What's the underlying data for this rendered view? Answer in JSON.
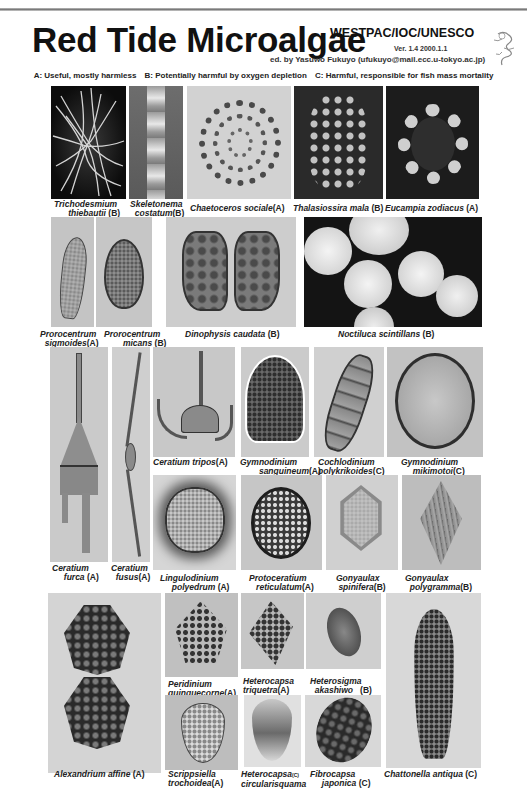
{
  "header": {
    "title": "Red Tide Microalgae",
    "organization": "WESTPAC/IOC/UNESCO",
    "version": "Ver. 1.4   2000.1.1",
    "logo_label": "WESTPAC-HAB",
    "editor": "ed. by Yasuwo Fukuyo (ufukuyo@mail.ecc.u-tokyo.ac.jp)"
  },
  "legend": {
    "a": "A: Useful, mostly harmless",
    "b": "B: Potentially harmful by oxygen depletion",
    "c": "C: Harmful, responsible for fish mass mortality"
  },
  "species": [
    {
      "genus": "Trichodesmium",
      "species": "thiebautii",
      "category": "(B)"
    },
    {
      "genus": "Skeletonema",
      "species": "costatum",
      "category": "(B)"
    },
    {
      "genus": "Chaetoceros",
      "species": "sociale",
      "category": "(A)"
    },
    {
      "genus": "Thalasiossira",
      "species": "mala",
      "category": "(B)"
    },
    {
      "genus": "Eucampia",
      "species": "zodiacus",
      "category": "(A)"
    },
    {
      "genus": "Prorocentrum",
      "species": "sigmoides",
      "category": "(A)"
    },
    {
      "genus": "Prorocentrum",
      "species": "micans",
      "category": "(B)"
    },
    {
      "genus": "Dinophysis",
      "species": "caudata",
      "category": "(B)"
    },
    {
      "genus": "Noctiluca",
      "species": "scintillans",
      "category": "(B)"
    },
    {
      "genus": "Ceratium",
      "species": "furca",
      "category": "(A)"
    },
    {
      "genus": "Ceratium",
      "species": "fusus",
      "category": "(A)"
    },
    {
      "genus": "Ceratium",
      "species": "tripos",
      "category": "(A)"
    },
    {
      "genus": "Gymnodinium",
      "species": "sanguineum",
      "category": "(A)"
    },
    {
      "genus": "Cochlodinium",
      "species": "polykrikoides",
      "category": "(C)"
    },
    {
      "genus": "Gymnodinium",
      "species": "mikimotoi",
      "category": "(C)"
    },
    {
      "genus": "Lingulodinium",
      "species": "polyedrum",
      "category": "(A)"
    },
    {
      "genus": "Protoceratium",
      "species": "reticulatum",
      "category": "(A)"
    },
    {
      "genus": "Gonyaulax",
      "species": "spinifera",
      "category": "(B)"
    },
    {
      "genus": "Gonyaulax",
      "species": "polygramma",
      "category": "(B)"
    },
    {
      "genus": "Alexandrium",
      "species": "affine",
      "category": "(A)"
    },
    {
      "genus": "Peridinium",
      "species": "quinquecorne",
      "category": "(A)"
    },
    {
      "genus": "Heterocapsa",
      "species": "triquetra",
      "category": "(A)"
    },
    {
      "genus": "Heterosigma",
      "species": "akashiwo",
      "category": "(B)"
    },
    {
      "genus": "Chattonella",
      "species": "antiqua",
      "category": "(C)"
    },
    {
      "genus": "Scrippsiella",
      "species": "trochoidea",
      "category": "(A)"
    },
    {
      "genus": "Heterocapsa",
      "species": "circularisquama",
      "category": "(C)"
    },
    {
      "genus": "Fibrocapsa",
      "species": "japonica",
      "category": "(C)"
    }
  ]
}
